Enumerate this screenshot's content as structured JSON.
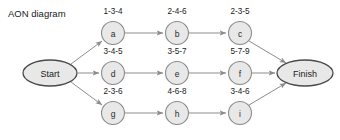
{
  "diagram": {
    "title": "AON diagram",
    "type": "activity-on-node-network",
    "terminals": {
      "start": {
        "label": "Start",
        "cx": 50,
        "cy": 73,
        "rx": 27,
        "ry": 13
      },
      "finish": {
        "label": "Finish",
        "cx": 305,
        "cy": 73,
        "rx": 28,
        "ry": 13
      }
    },
    "nodes": [
      {
        "id": "a",
        "label": "a",
        "estimate": "1-3-4",
        "cx": 113,
        "cy": 33,
        "r": 11.5
      },
      {
        "id": "b",
        "label": "b",
        "estimate": "2-4-6",
        "cx": 177,
        "cy": 33,
        "r": 11.5
      },
      {
        "id": "c",
        "label": "c",
        "estimate": "2-3-5",
        "cx": 240,
        "cy": 33,
        "r": 11.5
      },
      {
        "id": "d",
        "label": "d",
        "estimate": "3-4-5",
        "cx": 113,
        "cy": 73,
        "r": 11.5
      },
      {
        "id": "e",
        "label": "e",
        "estimate": "3-5-7",
        "cx": 177,
        "cy": 73,
        "r": 11.5
      },
      {
        "id": "f",
        "label": "f",
        "estimate": "5-7-9",
        "cx": 240,
        "cy": 73,
        "r": 11.5
      },
      {
        "id": "g",
        "label": "g",
        "estimate": "2-3-6",
        "cx": 113,
        "cy": 113,
        "r": 11.5
      },
      {
        "id": "h",
        "label": "h",
        "estimate": "4-6-8",
        "cx": 177,
        "cy": 113,
        "r": 11.5
      },
      {
        "id": "i",
        "label": "i",
        "estimate": "3-4-6",
        "cx": 240,
        "cy": 113,
        "r": 11.5
      }
    ],
    "edges": [
      {
        "from": "start",
        "to": "a",
        "x1": 71,
        "y1": 64,
        "x2": 102,
        "y2": 41
      },
      {
        "from": "start",
        "to": "d",
        "x1": 78,
        "y1": 73,
        "x2": 99,
        "y2": 73
      },
      {
        "from": "start",
        "to": "g",
        "x1": 71,
        "y1": 82,
        "x2": 102,
        "y2": 105
      },
      {
        "from": "a",
        "to": "b",
        "x1": 125,
        "y1": 33,
        "x2": 163,
        "y2": 33
      },
      {
        "from": "b",
        "to": "c",
        "x1": 189,
        "y1": 33,
        "x2": 226,
        "y2": 33
      },
      {
        "from": "d",
        "to": "e",
        "x1": 125,
        "y1": 73,
        "x2": 163,
        "y2": 73
      },
      {
        "from": "e",
        "to": "f",
        "x1": 189,
        "y1": 73,
        "x2": 226,
        "y2": 73
      },
      {
        "from": "g",
        "to": "h",
        "x1": 125,
        "y1": 113,
        "x2": 163,
        "y2": 113
      },
      {
        "from": "h",
        "to": "i",
        "x1": 189,
        "y1": 113,
        "x2": 226,
        "y2": 113
      },
      {
        "from": "c",
        "to": "finish",
        "x1": 249,
        "y1": 41,
        "x2": 286,
        "y2": 63
      },
      {
        "from": "f",
        "to": "finish",
        "x1": 252,
        "y1": 73,
        "x2": 275,
        "y2": 73
      },
      {
        "from": "i",
        "to": "finish",
        "x1": 249,
        "y1": 105,
        "x2": 286,
        "y2": 83
      }
    ],
    "colors": {
      "node_fill": "#e8e8e8",
      "node_stroke": "#8c8c8c",
      "terminal_stroke": "#4a4a4a",
      "edge_stroke": "#8c8c8c",
      "text": "#1a1a1a",
      "background": "#ffffff"
    }
  }
}
